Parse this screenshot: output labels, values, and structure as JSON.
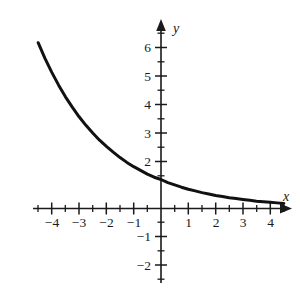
{
  "chart_data": {
    "type": "line",
    "title": "",
    "subtitle": "",
    "xlabel": "x",
    "ylabel": "y",
    "xlim": [
      -4.7,
      4.7
    ],
    "ylim": [
      -2.6,
      6.6
    ],
    "grid": false,
    "legend": null,
    "annotations": [],
    "axis_style": {
      "arrows": "both-ends-positive",
      "major_tick_step": 1,
      "minor_tick_step": 0.5,
      "line_color": "#1a1a1a",
      "curve_color": "#111111"
    },
    "x_major_ticks": [
      -4,
      -3,
      -2,
      -1,
      1,
      2,
      3,
      4
    ],
    "x_tick_labels": [
      "−4",
      "−3",
      "−2",
      "−1",
      "1",
      "2",
      "3",
      "4"
    ],
    "y_major_ticks": [
      -2,
      -1,
      1,
      2,
      3,
      4,
      5,
      6
    ],
    "y_tick_labels": [
      "−2",
      "−1",
      "",
      "2",
      "3",
      "4",
      "5",
      "6"
    ],
    "series": [
      {
        "name": "exponential decay",
        "equation": "y = (1/2)^x",
        "color": "#111111",
        "x": [
          -4.5,
          -4.25,
          -4,
          -3.75,
          -3.5,
          -3.25,
          -3,
          -2.75,
          -2.5,
          -2.25,
          -2,
          -1.75,
          -1.5,
          -1.25,
          -1,
          -0.75,
          -0.5,
          -0.25,
          0,
          0.25,
          0.5,
          0.75,
          1,
          1.25,
          1.5,
          1.75,
          2,
          2.25,
          2.5,
          2.75,
          3,
          3.25,
          3.5,
          3.75,
          4,
          4.25,
          4.5
        ],
        "y": [
          5.8,
          5.25,
          4.76,
          4.31,
          3.9,
          3.54,
          3.2,
          2.9,
          2.63,
          2.38,
          2.16,
          1.96,
          1.77,
          1.6,
          1.45,
          1.32,
          1.19,
          1.08,
          1.0,
          0.89,
          0.81,
          0.73,
          0.66,
          0.6,
          0.54,
          0.49,
          0.44,
          0.4,
          0.36,
          0.33,
          0.3,
          0.27,
          0.24,
          0.22,
          0.2,
          0.18,
          0.16
        ]
      }
    ]
  },
  "labels": {
    "x_axis_name": "x",
    "y_axis_name": "y",
    "x": {
      "m4": "−4",
      "m3": "−3",
      "m2": "−2",
      "m1": "−1",
      "p1": "1",
      "p2": "2",
      "p3": "3",
      "p4": "4"
    },
    "y": {
      "p6": "6",
      "p5": "5",
      "p4": "4",
      "p3": "3",
      "p2": "2",
      "m1": "−1",
      "m2": "−2"
    }
  }
}
